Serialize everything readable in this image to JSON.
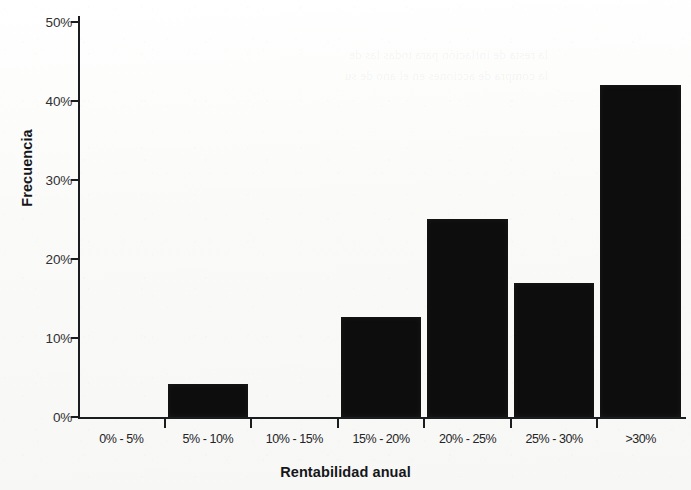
{
  "figure": {
    "background_color": "#fbfbfa",
    "bar_color": "#0d0d0e",
    "axis_color": "#1b1c1f"
  },
  "chart_data": {
    "type": "bar",
    "title": "",
    "subtitle": "",
    "xlabel": "Rentabilidad anual",
    "ylabel": "Frecuencia",
    "categories": [
      "0% - 5%",
      "5% - 10%",
      "10% - 15%",
      "15% - 20%",
      "20% - 25%",
      "25% - 30%",
      ">30%"
    ],
    "values": [
      0,
      4.2,
      0,
      12.7,
      25.1,
      17.0,
      42.0
    ],
    "value_labels": [
      "0%",
      "4.2%",
      "0%",
      "12.7%",
      "25.1%",
      "17%",
      "42%"
    ],
    "ylim": [
      0,
      50
    ],
    "yticks": [
      0,
      10,
      20,
      30,
      40,
      50
    ],
    "ytick_labels": [
      "0%",
      "10%",
      "20%",
      "30%",
      "40%",
      "50%"
    ],
    "grid": false,
    "legend": null,
    "legend_position": "none",
    "series": [
      {
        "name": "Frecuencia",
        "values": [
          0,
          4.2,
          0,
          12.7,
          25.1,
          17.0,
          42.0
        ]
      }
    ]
  },
  "bleed_through": {
    "line1": "la resta de inflación para todas las de",
    "line2": "la compra de acciones en el ano de su"
  }
}
